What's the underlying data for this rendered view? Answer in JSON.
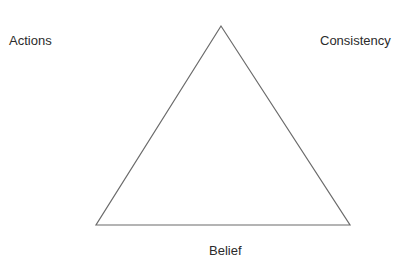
{
  "diagram": {
    "type": "triangle",
    "labels": {
      "top_left": "Actions",
      "top_right": "Consistency",
      "bottom": "Belief"
    },
    "triangle": {
      "vertices": [
        [
          221,
          26
        ],
        [
          96,
          225
        ],
        [
          350,
          225
        ]
      ],
      "stroke_color": "#6b6b6b",
      "stroke_width": 1.2,
      "fill": "none"
    },
    "colors": {
      "background": "#ffffff",
      "text": "#2b2b2b"
    }
  }
}
